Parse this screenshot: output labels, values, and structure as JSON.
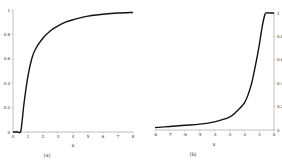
{
  "chart_data": [
    {
      "type": "line",
      "panel_label": "(a)",
      "title": "",
      "xlabel": "x",
      "ylabel": "",
      "xlim": [
        0,
        8
      ],
      "ylim": [
        0,
        1
      ],
      "x_ticks": [
        "0",
        "1",
        "2",
        "3",
        "4",
        "5",
        "6",
        "7",
        "8"
      ],
      "y_ticks": [
        "0",
        "0.2",
        "0.4",
        "0.6",
        "0.8",
        "1"
      ],
      "y_axis_position": "left",
      "grid": false,
      "series": [
        {
          "name": "curve-a",
          "color": "#111111",
          "x": [
            0,
            0.3,
            0.5,
            0.6,
            0.75,
            1.0,
            1.25,
            1.5,
            2.0,
            2.5,
            3.0,
            3.5,
            4.0,
            5.0,
            6.0,
            7.0,
            8.0
          ],
          "y": [
            0,
            0,
            0.0,
            0.08,
            0.25,
            0.46,
            0.6,
            0.68,
            0.77,
            0.83,
            0.87,
            0.9,
            0.92,
            0.95,
            0.965,
            0.975,
            0.98
          ]
        }
      ]
    },
    {
      "type": "line",
      "panel_label": "(b)",
      "title": "",
      "xlabel": "x",
      "ylabel": "",
      "xlim": [
        -8,
        0
      ],
      "ylim": [
        0,
        1
      ],
      "x_ticks": [
        "-8",
        "-7",
        "-6",
        "-5",
        "-4",
        "-3",
        "-2",
        "-1",
        "0"
      ],
      "y_ticks": [
        "0",
        "0.2",
        "0.4",
        "0.6",
        "0.8",
        "1"
      ],
      "y_axis_position": "right",
      "grid": false,
      "series": [
        {
          "name": "curve-b",
          "color": "#111111",
          "x": [
            -8,
            -7,
            -6,
            -5,
            -4,
            -3,
            -2.5,
            -2,
            -1.75,
            -1.5,
            -1.25,
            -1.0,
            -0.8,
            -0.65,
            -0.55,
            -0.3,
            0
          ],
          "y": [
            0.02,
            0.03,
            0.04,
            0.05,
            0.07,
            0.11,
            0.16,
            0.23,
            0.3,
            0.4,
            0.55,
            0.72,
            0.88,
            0.97,
            1.0,
            1.0,
            1.0
          ]
        }
      ]
    }
  ]
}
